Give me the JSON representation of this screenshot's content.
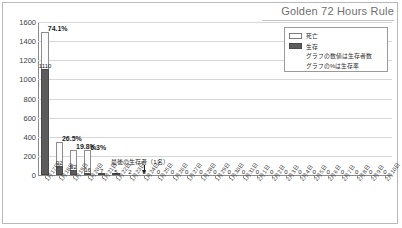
{
  "chart_title": "Golden 72 Hours Rule",
  "legend": {
    "items": [
      {
        "label": "死亡",
        "color": "#fbfbfb",
        "key": "death"
      },
      {
        "label": "生存",
        "color": "#5c5c5c",
        "key": "survive"
      }
    ],
    "notes": [
      "グラフの数値は生存者数",
      "グラフの%は生存率"
    ]
  },
  "annotation": {
    "text": "最後の生存者（1名）"
  },
  "chart_data": {
    "type": "bar",
    "title": "Golden 72 Hours Rule",
    "subtype": "stacked",
    "xlabel": "",
    "ylabel": "",
    "ylim": [
      0,
      1600
    ],
    "ytick_values": [
      0,
      200,
      400,
      600,
      800,
      1000,
      1200,
      1400,
      1600
    ],
    "ytick_labels": [
      "0",
      "200",
      "400",
      "600",
      "800",
      "1000",
      "1200",
      "1400",
      "1600"
    ],
    "grid": true,
    "legend_position": "top-right",
    "categories": [
      "1月17日",
      "1月18日",
      "1月19日",
      "1月20日",
      "1月21日",
      "1月22日",
      "1月23日",
      "1月24日",
      "1月25日",
      "1月26日",
      "1月27日",
      "1月28日",
      "1月29日",
      "1月30日",
      "1月31日",
      "2月1日",
      "2月2日",
      "2月3日",
      "2月4日",
      "2月5日",
      "2月6日",
      "2月7日",
      "2月8日",
      "2月9日",
      "2月10日"
    ],
    "series": [
      {
        "name": "生存",
        "values": [
          1110,
          92,
          52,
          16,
          7,
          5,
          2,
          1,
          0,
          0,
          0,
          0,
          0,
          0,
          0,
          0,
          0,
          0,
          0,
          0,
          0,
          0,
          0,
          0,
          0
        ]
      },
      {
        "name": "死亡",
        "values": [
          388,
          255,
          210,
          238,
          0,
          0,
          0,
          0,
          0,
          0,
          0,
          0,
          0,
          0,
          0,
          0,
          0,
          0,
          0,
          0,
          0,
          0,
          0,
          0,
          0
        ]
      }
    ],
    "totals": [
      1498,
      347,
      262,
      254,
      7,
      5,
      2,
      1,
      0,
      0,
      0,
      0,
      0,
      0,
      0,
      0,
      0,
      0,
      0,
      0,
      0,
      0,
      0,
      0,
      0
    ],
    "percent_labels": [
      "74.1%",
      "26.5%",
      "19.8%",
      "6.3%",
      "",
      "",
      "",
      "",
      "",
      "",
      "",
      "",
      "",
      "",
      "",
      "",
      "",
      "",
      "",
      "",
      "",
      "",
      "",
      "",
      ""
    ],
    "value_labels": [
      "1110",
      "92",
      "52",
      "16",
      "7",
      "5",
      "2",
      "0",
      "0",
      "0",
      "0",
      "0",
      "0",
      "0",
      "0",
      "0",
      "0",
      "0",
      "0",
      "0",
      "0",
      "0",
      "0",
      "0",
      "0"
    ],
    "annotations": [
      {
        "text": "最後の生存者（1名）",
        "category": "1月24日"
      }
    ]
  }
}
